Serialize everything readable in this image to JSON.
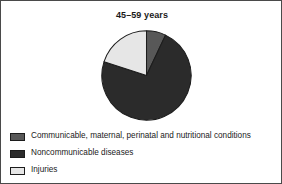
{
  "figure": {
    "border_color": "#4a4a4a",
    "background": "#ffffff"
  },
  "chart_data": {
    "type": "pie",
    "title": "45–59 years",
    "subtitle": "",
    "xlabel": "",
    "ylabel": "",
    "legend_position": "bottom-left",
    "grid": false,
    "start_angle_deg": 0,
    "direction": "clockwise",
    "categories": [
      "Communicable, maternal, perinatal and nutritional conditions",
      "Noncommunicable diseases",
      "Injuries"
    ],
    "values": [
      7,
      73,
      20
    ],
    "colors": [
      "#585858",
      "#2b2b2b",
      "#e6e6e6"
    ],
    "slices": [
      {
        "label": "Communicable, maternal, perinatal and nutritional conditions",
        "value": 7,
        "color": "#585858",
        "start_deg": 0,
        "end_deg": 25.2
      },
      {
        "label": "Noncommunicable diseases",
        "value": 73,
        "color": "#2b2b2b",
        "start_deg": 25.2,
        "end_deg": 288.0
      },
      {
        "label": "Injuries",
        "value": 20,
        "color": "#e6e6e6",
        "start_deg": 288.0,
        "end_deg": 360.0
      }
    ],
    "slice_edge_color": "#1c1c1c"
  },
  "legend": {
    "items": [
      {
        "label": "Communicable, maternal, perinatal and nutritional conditions",
        "color": "#585858"
      },
      {
        "label": "Noncommunicable diseases",
        "color": "#2b2b2b"
      },
      {
        "label": "Injuries",
        "color": "#e6e6e6"
      }
    ]
  }
}
